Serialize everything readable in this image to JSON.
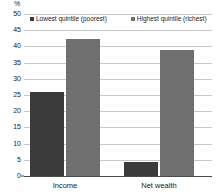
{
  "chart_data": {
    "type": "bar",
    "title": "",
    "subtitle": "",
    "xlabel": "",
    "ylabel": "%",
    "categories": [
      "Income",
      "Net wealth"
    ],
    "series": [
      {
        "name": "Lowest quintile (poorest)",
        "color": "#3b3b3b",
        "values": [
          26.0,
          4.3
        ]
      },
      {
        "name": "Highest quintile (richest)",
        "color": "#6f6f6f",
        "values": [
          42.2,
          38.8
        ]
      }
    ],
    "ylim": [
      0,
      50
    ],
    "ytick_step": 5,
    "ytick_labels": [
      "50",
      "45",
      "40",
      "35",
      "30",
      "25",
      "20",
      "15",
      "10",
      "5",
      "0"
    ],
    "ytick_values": [
      50,
      45,
      40,
      35,
      30,
      25,
      20,
      15,
      10,
      5,
      0
    ],
    "grid": true,
    "legend_position": "top-inside"
  },
  "legend": {
    "items": [
      {
        "label": "Lowest quintile (poorest)"
      },
      {
        "label": "Highest quintile (richest)"
      }
    ]
  },
  "axis": {
    "unit": "%"
  }
}
